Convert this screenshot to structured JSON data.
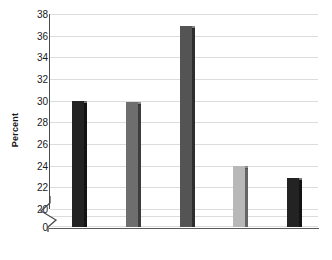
{
  "chart_data": {
    "type": "bar",
    "title": "",
    "subtitle": "",
    "xlabel": "",
    "ylabel": "Percent",
    "categories": [
      "",
      "",
      "",
      "",
      ""
    ],
    "values": [
      30.0,
      29.9,
      36.9,
      24.0,
      22.9
    ],
    "bar_colors": [
      "#232323",
      "#6e6e6e",
      "#545454",
      "#b8b8b8",
      "#232323"
    ],
    "ylim": [
      20,
      38
    ],
    "y_axis_break": true,
    "y_axis_break_symbol": "zigzag",
    "yticks": [
      0,
      20,
      22,
      24,
      26,
      28,
      30,
      32,
      34,
      36,
      38
    ],
    "ytick_labels": [
      "0",
      "20",
      "22",
      "24",
      "26",
      "28",
      "30",
      "32",
      "34",
      "36",
      "38"
    ],
    "grid": true,
    "grid_axis": "y",
    "grid_color": "#dcdcdc",
    "legend": false,
    "legend_position": "none",
    "axis_color": "#4a4a4a",
    "text_color": "#1a1a1a",
    "background": "#ffffff"
  },
  "axis": {
    "ylabel": "Percent",
    "zero_label": "0"
  }
}
